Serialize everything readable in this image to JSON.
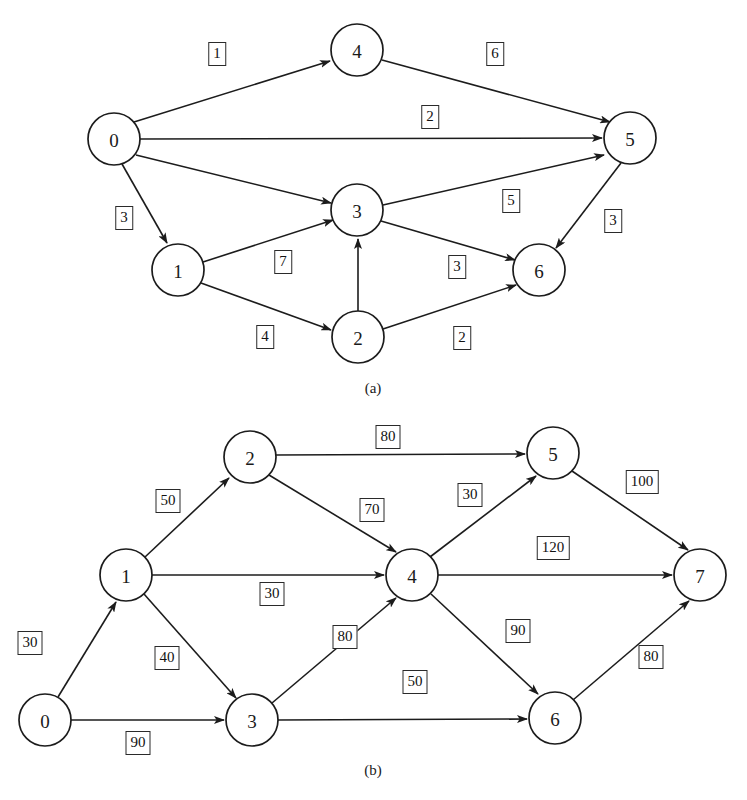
{
  "figure": {
    "type": "directed-weighted-graph-figure",
    "panel_count": 2,
    "background_color": "#ffffff",
    "stroke_color": "#1c1c1c"
  },
  "panels": [
    {
      "id": "a",
      "caption": "(a)",
      "caption_pos": {
        "x": 373,
        "y": 388
      },
      "node_radius": 26,
      "nodes": [
        {
          "label": "0",
          "x": 114,
          "y": 139
        },
        {
          "label": "1",
          "x": 178,
          "y": 270
        },
        {
          "label": "2",
          "x": 358,
          "y": 337
        },
        {
          "label": "3",
          "x": 357,
          "y": 210
        },
        {
          "label": "4",
          "x": 357,
          "y": 50
        },
        {
          "label": "5",
          "x": 630,
          "y": 138
        },
        {
          "label": "6",
          "x": 539,
          "y": 270
        }
      ],
      "edges": [
        {
          "from": "0",
          "to": "4",
          "weight": "1",
          "label_x": 217,
          "label_y": 54
        },
        {
          "from": "0",
          "to": "5",
          "weight": "2",
          "label_x": 430,
          "label_y": 117
        },
        {
          "from": "0",
          "to": "3",
          "weight": "7",
          "label_x": 283,
          "label_y": 262
        },
        {
          "from": "0",
          "to": "1",
          "weight": "3",
          "label_x": 124,
          "label_y": 218
        },
        {
          "from": "4",
          "to": "5",
          "weight": "6",
          "label_x": 495,
          "label_y": 54
        },
        {
          "from": "1",
          "to": "3",
          "weight": "7",
          "label_x": 283,
          "label_y": 262
        },
        {
          "from": "1",
          "to": "2",
          "weight": "4",
          "label_x": 265,
          "label_y": 337
        },
        {
          "from": "2",
          "to": "3",
          "weight": "0",
          "label_x": 0,
          "label_y": 0
        },
        {
          "from": "2",
          "to": "6",
          "weight": "2",
          "label_x": 462,
          "label_y": 338
        },
        {
          "from": "3",
          "to": "5",
          "weight": "5",
          "label_x": 511,
          "label_y": 201
        },
        {
          "from": "3",
          "to": "6",
          "weight": "3",
          "label_x": 457,
          "label_y": 267
        },
        {
          "from": "5",
          "to": "6",
          "weight": "3",
          "label_x": 613,
          "label_y": 221
        }
      ],
      "weight_labels": [
        {
          "text": "1",
          "x": 217,
          "y": 54
        },
        {
          "text": "6",
          "x": 495,
          "y": 54
        },
        {
          "text": "2",
          "x": 430,
          "y": 117
        },
        {
          "text": "3",
          "x": 124,
          "y": 218
        },
        {
          "text": "5",
          "x": 511,
          "y": 201
        },
        {
          "text": "3",
          "x": 613,
          "y": 221
        },
        {
          "text": "7",
          "x": 283,
          "y": 262
        },
        {
          "text": "3",
          "x": 457,
          "y": 267
        },
        {
          "text": "4",
          "x": 265,
          "y": 337
        },
        {
          "text": "2",
          "x": 462,
          "y": 338
        }
      ]
    },
    {
      "id": "b",
      "caption": "(b)",
      "caption_pos": {
        "x": 373,
        "y": 370
      },
      "node_radius": 26,
      "nodes": [
        {
          "label": "0",
          "x": 45,
          "y": 320
        },
        {
          "label": "1",
          "x": 126,
          "y": 175
        },
        {
          "label": "2",
          "x": 250,
          "y": 57
        },
        {
          "label": "3",
          "x": 252,
          "y": 320
        },
        {
          "label": "4",
          "x": 412,
          "y": 175
        },
        {
          "label": "5",
          "x": 553,
          "y": 53
        },
        {
          "label": "6",
          "x": 555,
          "y": 318
        },
        {
          "label": "7",
          "x": 700,
          "y": 175
        }
      ],
      "edges": [
        {
          "from": "0",
          "to": "1",
          "weight": "30"
        },
        {
          "from": "0",
          "to": "3",
          "weight": "90"
        },
        {
          "from": "1",
          "to": "2",
          "weight": "50"
        },
        {
          "from": "1",
          "to": "4",
          "weight": "30"
        },
        {
          "from": "1",
          "to": "3",
          "weight": "40"
        },
        {
          "from": "2",
          "to": "5",
          "weight": "80"
        },
        {
          "from": "2",
          "to": "4",
          "weight": "70"
        },
        {
          "from": "3",
          "to": "4",
          "weight": "80"
        },
        {
          "from": "3",
          "to": "6",
          "weight": "50"
        },
        {
          "from": "4",
          "to": "5",
          "weight": "30"
        },
        {
          "from": "4",
          "to": "7",
          "weight": "120"
        },
        {
          "from": "4",
          "to": "6",
          "weight": "90"
        },
        {
          "from": "5",
          "to": "7",
          "weight": "100"
        },
        {
          "from": "6",
          "to": "7",
          "weight": "80"
        }
      ],
      "weight_labels": [
        {
          "text": "80",
          "x": 388,
          "y": 37
        },
        {
          "text": "50",
          "x": 168,
          "y": 101
        },
        {
          "text": "70",
          "x": 372,
          "y": 110
        },
        {
          "text": "30",
          "x": 470,
          "y": 95
        },
        {
          "text": "100",
          "x": 642,
          "y": 82
        },
        {
          "text": "120",
          "x": 553,
          "y": 148
        },
        {
          "text": "30",
          "x": 272,
          "y": 194
        },
        {
          "text": "30",
          "x": 30,
          "y": 243
        },
        {
          "text": "40",
          "x": 167,
          "y": 258
        },
        {
          "text": "80",
          "x": 345,
          "y": 237
        },
        {
          "text": "90",
          "x": 518,
          "y": 231
        },
        {
          "text": "80",
          "x": 651,
          "y": 257
        },
        {
          "text": "50",
          "x": 415,
          "y": 282
        },
        {
          "text": "90",
          "x": 138,
          "y": 343
        }
      ]
    }
  ]
}
